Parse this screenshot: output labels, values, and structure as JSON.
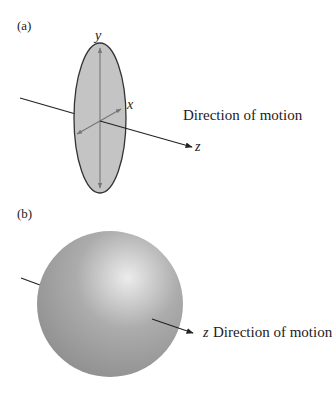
{
  "panel_a": {
    "label": "(a)",
    "axis_y": "y",
    "axis_x": "x",
    "axis_z": "z",
    "direction": "Direction of motion"
  },
  "panel_b": {
    "label": "(b)",
    "axis_z": "z",
    "direction": "Direction of motion"
  },
  "colors": {
    "ellipse_fill": "#c4c4c4",
    "outline": "#333333",
    "sphere_light": "#ececec",
    "sphere_dark": "#8c8c8c"
  }
}
